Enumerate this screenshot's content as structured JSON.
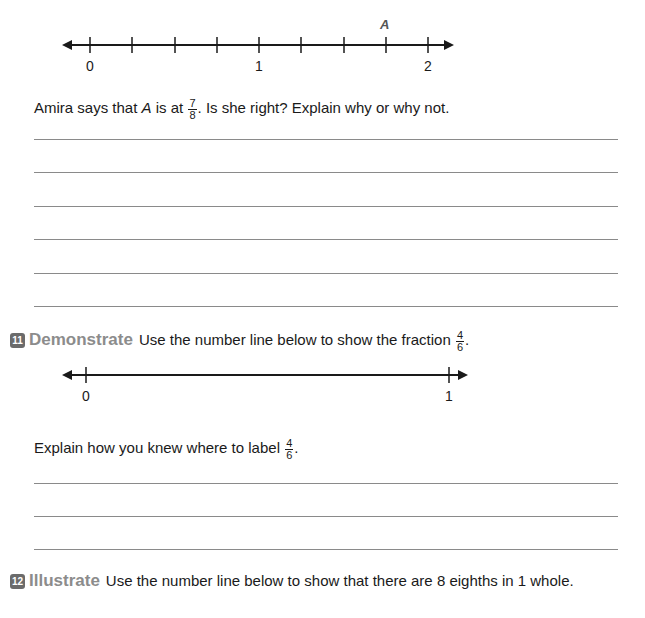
{
  "problem10": {
    "number_line": {
      "point_label": "A",
      "labels": [
        "0",
        "1",
        "2"
      ]
    },
    "question_pre": "Amira says that ",
    "question_var": "A",
    "question_mid": " is at ",
    "question_frac": {
      "num": "7",
      "den": "8"
    },
    "question_post": ". Is she right? Explain why or why not.",
    "answer_lines": 6
  },
  "problem11": {
    "badge": "11",
    "keyword": "Demonstrate",
    "prompt": "Use the number line below to show the fraction ",
    "prompt_frac": {
      "num": "4",
      "den": "6"
    },
    "prompt_post": ".",
    "number_line": {
      "labels": [
        "0",
        "1"
      ]
    },
    "followup": "Explain how you knew where to label ",
    "followup_frac": {
      "num": "4",
      "den": "6"
    },
    "followup_post": ".",
    "answer_lines": 3
  },
  "problem12": {
    "badge": "12",
    "keyword": "Illustrate",
    "prompt": "Use the number line below to show that there are 8 eighths in 1 whole."
  }
}
